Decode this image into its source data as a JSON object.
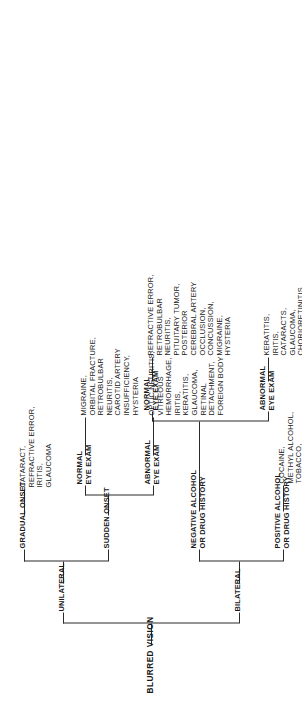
{
  "diagram": {
    "title": "BLURRED VISION",
    "type": "clinical decision tree",
    "root": {
      "label": "BLURRED VISION"
    },
    "branches": {
      "unilateral": {
        "label": "UNILATERAL",
        "gradual_onset": {
          "label": "GRADUAL ONSET",
          "diagnoses": "CATARACT,\nREFRACTIVE ERROR,\nIRITIS,\nGLAUCOMA"
        },
        "sudden_onset": {
          "label": "SUDDEN ONSET",
          "normal_eye_exam": {
            "label": "NORMAL\nEYE EXAM",
            "diagnoses": "MIGRAINE,\nORBITAL FRACTURE,\nRETROBULBAR\nNEURITIS,\nCAROTID ARTERY\nINSUFFICIENCY,\nHYSTERIA"
          },
          "abnormal_eye_exam": {
            "label": "ABNORMAL\nEYE EXAM",
            "diagnoses": "OPTIC NEURITIS,\nVITREOUS\nHEMORRHAGE,\nIRITIS,\nKERATITIS,\nGLAUCOMA,\nRETINAL\nDETACHMENT,\nFOREIGN BODY"
          }
        }
      },
      "bilateral": {
        "label": "BILATERAL",
        "positive_history": {
          "label": "POSITIVE ALCOHOL\nOR DRUG HISTORY",
          "diagnoses": "COCAINE,\nMETHYL ALCOHOL,\nTOBACCO,\nBARBITURATES,\nETC."
        },
        "negative_history": {
          "label": "NEGATIVE ALCOHOL\nOR DRUG HISTORY",
          "abnormal_eye_exam": {
            "label": "ABNORMAL\nEYE EXAM",
            "diagnoses": "KERATITIS,\nIRITIS,\nCATARACTS,\nGLAUCOMA,\nCHORIORETINITIS,\nRETINITIS\nPIGMENTOSA,\nOPTIC ATROPHY,\nPAPILLEDEMA,\nPAPILLITIS"
          },
          "normal_eye_exam": {
            "label": "NORMAL\nEYE EXAM",
            "diagnoses": "REFRACTIVE ERROR,\nRETROBULBAR\nNEURITIS,\nPITUITARY TUMOR,\nPOSTERIOR\nCEREBRAL ARTERY\nOCCLUSION,\nCONCUSSION,\nMIGRAINE,\nHYSTERIA"
          }
        }
      }
    },
    "colors": {
      "line": "#2b2b2b",
      "text": "#1a1a1a",
      "background": "#ffffff"
    }
  }
}
